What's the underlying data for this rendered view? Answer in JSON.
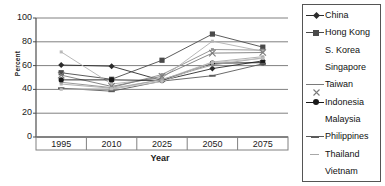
{
  "chart_data": {
    "type": "line",
    "title": "",
    "xlabel": "Year",
    "ylabel": "Percent",
    "x": [
      1995,
      2010,
      2025,
      2050,
      2075
    ],
    "categories": [
      "1995",
      "2010",
      "2025",
      "2050",
      "2075"
    ],
    "xtick_labels": [
      "1995",
      "2010",
      "2025",
      "2050",
      "2075"
    ],
    "ytick_labels": [
      "0",
      "20",
      "40",
      "60",
      "80",
      "100"
    ],
    "yticks": [
      0,
      20,
      40,
      60,
      80,
      100
    ],
    "ylim": [
      0,
      100
    ],
    "grid": "horizontal",
    "legend_position": "right",
    "series": [
      {
        "name": "China",
        "marker": "diamond",
        "color": "#2b2b2b",
        "values": [
          60.5,
          59.5,
          47.5,
          57.5,
          64.0
        ]
      },
      {
        "name": "Hong Kong",
        "marker": "square",
        "color": "#4a4a4a",
        "values": [
          54.0,
          48.5,
          64.5,
          86.5,
          75.5
        ]
      },
      {
        "name": "S. Korea",
        "marker": "none",
        "color": "#8c8c8c",
        "values": [
          46.0,
          41.5,
          52.5,
          73.5,
          73.0
        ]
      },
      {
        "name": "Singapore",
        "marker": "none",
        "color": "#b0b0b0",
        "values": [
          71.5,
          44.5,
          49.5,
          80.5,
          72.0
        ]
      },
      {
        "name": "Taiwan",
        "marker": "cross",
        "color": "#7a7a7a",
        "values": [
          52.0,
          42.5,
          51.0,
          70.5,
          71.0
        ]
      },
      {
        "name": "Indonesia",
        "marker": "circle",
        "color": "#1a1a1a",
        "values": [
          48.0,
          48.0,
          47.5,
          62.0,
          62.5
        ]
      },
      {
        "name": "Malaysia",
        "marker": "none",
        "color": "#9a9a9a",
        "values": [
          40.5,
          40.0,
          48.5,
          60.5,
          66.5
        ]
      },
      {
        "name": "Philippines",
        "marker": "dash",
        "color": "#5a5a5a",
        "values": [
          41.0,
          38.5,
          47.0,
          51.5,
          61.5
        ]
      },
      {
        "name": "Thailand",
        "marker": "none",
        "color": "#a8a8a8",
        "values": [
          44.5,
          41.0,
          48.0,
          63.0,
          67.5
        ]
      },
      {
        "name": "Vietnam",
        "marker": "none",
        "color": "#c0c0c0",
        "values": [
          40.0,
          40.5,
          46.5,
          62.5,
          66.0
        ]
      }
    ]
  },
  "axes": {
    "y_title": "Percent",
    "x_title": "Year"
  },
  "legend": {
    "items": [
      {
        "label": "China"
      },
      {
        "label": "Hong Kong"
      },
      {
        "label": "S. Korea"
      },
      {
        "label": "Singapore"
      },
      {
        "label": "Taiwan"
      },
      {
        "label": "Indonesia"
      },
      {
        "label": "Malaysia"
      },
      {
        "label": "Philippines"
      },
      {
        "label": "Thailand"
      },
      {
        "label": "Vietnam"
      }
    ]
  }
}
